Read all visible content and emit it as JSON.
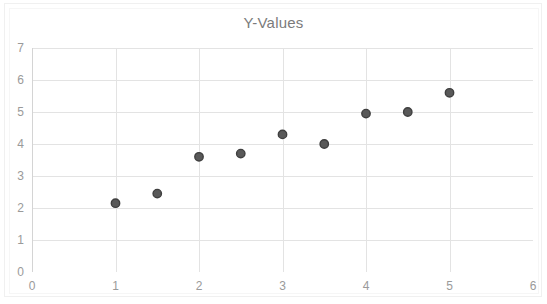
{
  "chart_data": {
    "type": "scatter",
    "title": "Y-Values",
    "xlabel": "",
    "ylabel": "",
    "xlim": [
      0,
      6
    ],
    "ylim": [
      0,
      7
    ],
    "x_ticks": [
      "0",
      "1",
      "2",
      "3",
      "4",
      "5",
      "6"
    ],
    "y_ticks": [
      "0",
      "1",
      "2",
      "3",
      "4",
      "5",
      "6",
      "7"
    ],
    "grid": "horizontal-and-vertical",
    "legend": "none",
    "series": [
      {
        "name": "Y-Values",
        "marker_fill": "#595959",
        "marker_stroke": "#3f3f3f",
        "points": [
          {
            "x": 1.0,
            "y": 2.15
          },
          {
            "x": 1.5,
            "y": 2.45
          },
          {
            "x": 2.0,
            "y": 3.6
          },
          {
            "x": 2.5,
            "y": 3.7
          },
          {
            "x": 3.0,
            "y": 4.3
          },
          {
            "x": 3.5,
            "y": 4.0
          },
          {
            "x": 4.0,
            "y": 4.95
          },
          {
            "x": 4.5,
            "y": 5.0
          },
          {
            "x": 5.0,
            "y": 5.6
          }
        ]
      }
    ],
    "colors": {
      "background": "#ffffff",
      "gridline": "#e3e3e3",
      "axis_line": "#d4d4d4",
      "tick_text": "#9a9a9a",
      "title_text": "#7b7b7b",
      "frame": "#f0f0f0"
    }
  }
}
